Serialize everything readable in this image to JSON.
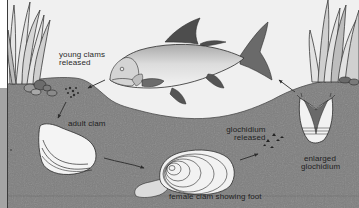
{
  "diagram": {
    "type": "life-cycle",
    "colors": {
      "water": "#f0f0f0",
      "sediment": "#7e7e7e",
      "sediment_dark": "#6f6f6f",
      "left_margin": "#9a9a9a",
      "outline": "#2b2b2b",
      "shell_light": "#ececec",
      "fish_body": "#cfcfcf",
      "fish_fin": "#555555"
    },
    "labels": {
      "young_clams": {
        "line1": "young clams",
        "line2": "released"
      },
      "adult_clam": "adult clam",
      "glochidium_released": {
        "line1": "glochidium",
        "line2": "released"
      },
      "enlarged_glochidium": {
        "line1": "enlarged",
        "line2": "glochidium"
      },
      "female_clam": "female clam showing foot"
    },
    "stages": [
      {
        "id": "glochidium-released",
        "label": "glochidium released"
      },
      {
        "id": "enlarged-glochidium",
        "label": "enlarged glochidium"
      },
      {
        "id": "fish-host",
        "label": "fish host"
      },
      {
        "id": "young-clams",
        "label": "young clams released"
      },
      {
        "id": "adult-clam",
        "label": "adult clam"
      },
      {
        "id": "female-clam",
        "label": "female clam showing foot"
      }
    ],
    "arrows": [
      {
        "from": "fish-host",
        "to": "young-clams"
      },
      {
        "from": "young-clams",
        "to": "adult-clam"
      },
      {
        "from": "adult-clam",
        "to": "female-clam"
      },
      {
        "from": "female-clam",
        "to": "glochidium-released"
      },
      {
        "from": "enlarged-glochidium",
        "to": "fish-host"
      }
    ]
  }
}
